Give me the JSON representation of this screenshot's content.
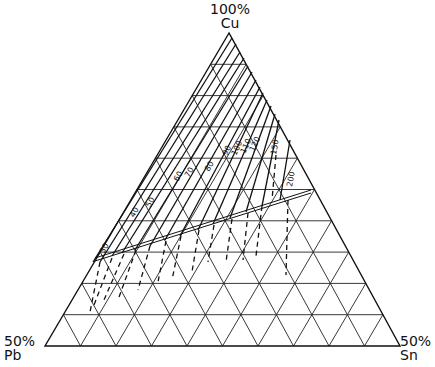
{
  "diagram": {
    "type": "ternary",
    "vertices": {
      "top": {
        "percent": "100%",
        "element": "Cu"
      },
      "bottom_left": {
        "percent": "50%",
        "element": "Pb"
      },
      "bottom_right": {
        "percent": "50%",
        "element": "Sn"
      }
    },
    "grid_divisions": 10,
    "isoline_labels": [
      "30",
      "40",
      "50",
      "60",
      "70",
      "80",
      "90",
      "100",
      "110",
      "120",
      "150",
      "200"
    ],
    "colors": {
      "ink": "#111111",
      "background": "#ffffff"
    }
  }
}
